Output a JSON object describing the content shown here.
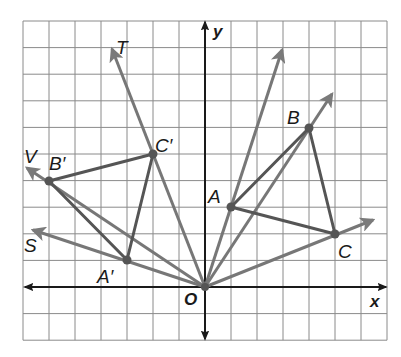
{
  "figure": {
    "grid": {
      "x_min": -7,
      "x_max": 7,
      "y_min": -2,
      "y_max": 10,
      "origin_px": [
        205,
        287
      ],
      "unit_px_x": 26,
      "unit_px_y": 26.6,
      "line_color": "#8a8a8a",
      "background": "#ffffff"
    },
    "axes": {
      "x_label": "x",
      "y_label": "y",
      "origin_label": "O",
      "color": "#1a1a1a"
    },
    "colors": {
      "segment": "#555555",
      "ray": "#777777",
      "point": "#555555"
    },
    "points": [
      {
        "name": "A",
        "label": "A",
        "x": 1,
        "y": 3
      },
      {
        "name": "B",
        "label": "B",
        "x": 4,
        "y": 6
      },
      {
        "name": "C",
        "label": "C",
        "x": 5,
        "y": 2
      },
      {
        "name": "A'",
        "label": "A′",
        "x": -3,
        "y": 1
      },
      {
        "name": "B'",
        "label": "B′",
        "x": -6,
        "y": 4
      },
      {
        "name": "C'",
        "label": "C′",
        "x": -2,
        "y": 5
      }
    ],
    "triangles": [
      {
        "name": "ABC",
        "vertices": [
          "A",
          "B",
          "C"
        ]
      },
      {
        "name": "A'B'C'",
        "vertices": [
          "A'",
          "B'",
          "C'"
        ]
      }
    ],
    "rays": [
      {
        "name": "ray-OA",
        "through": "A",
        "label": ""
      },
      {
        "name": "ray-OB",
        "through": "B",
        "label": ""
      },
      {
        "name": "ray-OC",
        "through": "C",
        "label": ""
      },
      {
        "name": "ray-OT",
        "through": "C'",
        "label": "T"
      },
      {
        "name": "ray-OV",
        "through": "B'",
        "label": "V"
      },
      {
        "name": "ray-OS",
        "through": "A'",
        "label": "S"
      }
    ],
    "segments_from_origin": [
      "A'",
      "B'",
      "C'"
    ],
    "labels": {
      "T": "T",
      "V": "V",
      "S": "S",
      "A": "A",
      "B": "B",
      "C": "C",
      "A_prime": "A′",
      "B_prime": "B′",
      "C_prime": "C′",
      "O": "O",
      "x": "x",
      "y": "y"
    }
  }
}
